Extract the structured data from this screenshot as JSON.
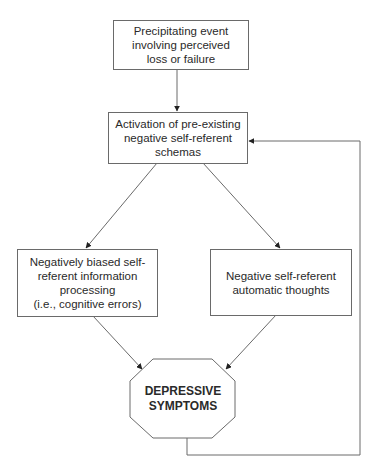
{
  "diagram": {
    "nodes": [
      {
        "id": "precipitating-event",
        "text": "Precipitating event\ninvolving perceived\nloss or failure",
        "shape": "rectangle"
      },
      {
        "id": "schema-activation",
        "text": "Activation of pre-existing\nnegative self-referent\nschemas",
        "shape": "rectangle"
      },
      {
        "id": "biased-processing",
        "text": "Negatively biased self-\nreferent information\nprocessing\n(i.e., cognitive errors)",
        "shape": "rectangle"
      },
      {
        "id": "automatic-thoughts",
        "text": "Negative self-referent\nautomatic thoughts",
        "shape": "rectangle"
      },
      {
        "id": "depressive-symptoms",
        "text": "DEPRESSIVE\nSYMPTOMS",
        "shape": "octagon"
      }
    ],
    "edges": [
      {
        "from": "precipitating-event",
        "to": "schema-activation"
      },
      {
        "from": "schema-activation",
        "to": "biased-processing"
      },
      {
        "from": "schema-activation",
        "to": "automatic-thoughts"
      },
      {
        "from": "biased-processing",
        "to": "depressive-symptoms"
      },
      {
        "from": "automatic-thoughts",
        "to": "depressive-symptoms"
      },
      {
        "from": "depressive-symptoms",
        "to": "schema-activation",
        "type": "feedback-loop"
      }
    ],
    "colors": {
      "line": "#6a6a6a",
      "text": "#2a2a2a",
      "background": "#ffffff"
    }
  }
}
